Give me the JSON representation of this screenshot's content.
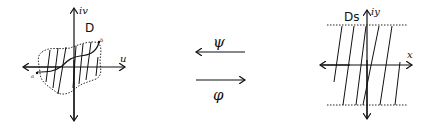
{
  "left_diagram": {
    "region_label": "D",
    "vertical_axis_label": "iv",
    "horizontal_axis_label": "u",
    "endpoint_a": "a",
    "endpoint_b": "b"
  },
  "maps": {
    "top_arrow_label": "ψ",
    "top_arrow_direction": "left",
    "bottom_arrow_label": "φ",
    "bottom_arrow_direction": "right"
  },
  "right_diagram": {
    "region_label": "Ds",
    "vertical_axis_label": "iy",
    "horizontal_axis_label": "x"
  },
  "colors": {
    "stroke": "#111111",
    "background": "#ffffff"
  }
}
